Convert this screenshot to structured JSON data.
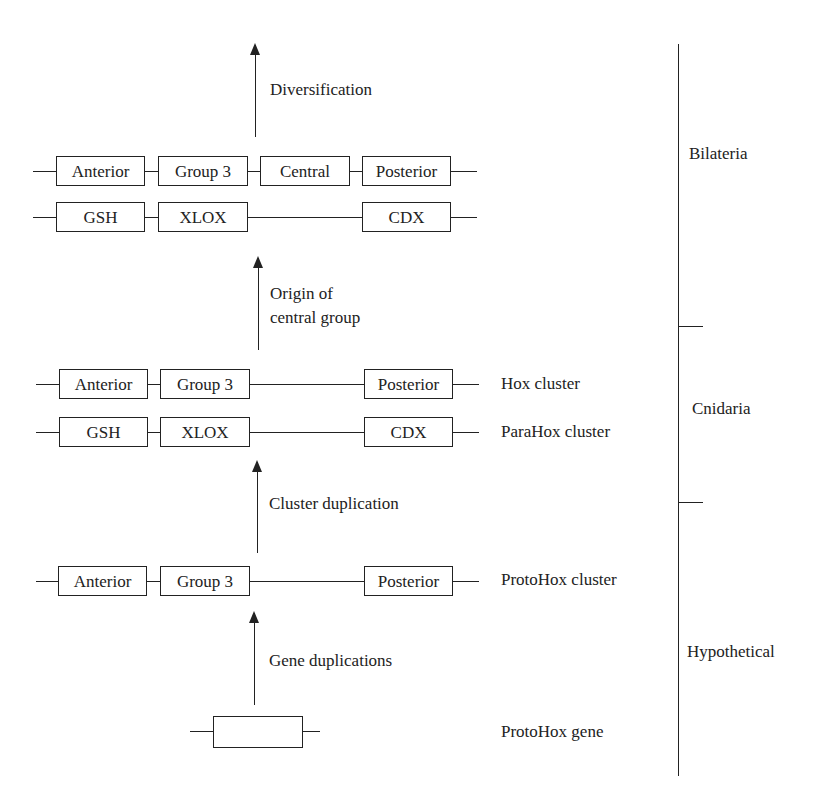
{
  "diagram": {
    "type": "evolutionary-gene-cluster-diagram",
    "rows": {
      "bilateria_hox": {
        "genes": [
          "Anterior",
          "Group 3",
          "Central",
          "Posterior"
        ]
      },
      "bilateria_parahox": {
        "genes": [
          "GSH",
          "XLOX",
          "CDX"
        ]
      },
      "cnidaria_hox": {
        "genes": [
          "Anterior",
          "Group 3",
          "Posterior"
        ],
        "label": "Hox cluster"
      },
      "cnidaria_parahox": {
        "genes": [
          "GSH",
          "XLOX",
          "CDX"
        ],
        "label": "ParaHox cluster"
      },
      "protohox_cluster": {
        "genes": [
          "Anterior",
          "Group 3",
          "Posterior"
        ],
        "label": "ProtoHox cluster"
      },
      "protohox_gene": {
        "genes": [
          ""
        ],
        "label": "ProtoHox gene"
      }
    },
    "transitions": [
      {
        "label": "Diversification"
      },
      {
        "label_line1": "Origin of",
        "label_line2": "central group"
      },
      {
        "label": "Cluster duplication"
      },
      {
        "label": "Gene duplications"
      }
    ],
    "clades": [
      {
        "label": "Bilateria"
      },
      {
        "label": "Cnidaria"
      },
      {
        "label": "Hypothetical"
      }
    ]
  }
}
